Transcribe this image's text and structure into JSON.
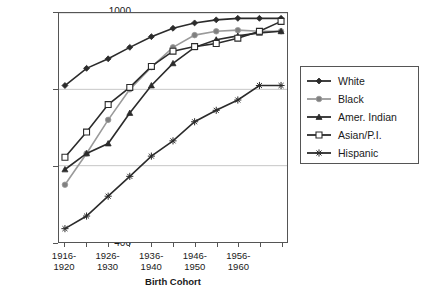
{
  "chart_data": {
    "type": "line",
    "title": "",
    "xlabel": "Birth Cohort",
    "ylabel": "Completion Ratio",
    "ylim": [
      400,
      1000
    ],
    "ytick_labels": [
      "1000",
      "800",
      "600",
      "400"
    ],
    "ytick_values": [
      1000,
      800,
      600,
      400
    ],
    "grid": "horizontal",
    "legend_position": "right-outside",
    "categories": [
      "1916-1920",
      "1921-1925",
      "1926-1930",
      "1931-1935",
      "1936-1940",
      "1941-1945",
      "1946-1950",
      "1951-1955",
      "1956-1960",
      "1961-1965",
      "1966-1970"
    ],
    "xtick_labels": [
      {
        "line1": "1916-",
        "line2": "1920",
        "index": 0
      },
      {
        "line1": "1926-",
        "line2": "1930",
        "index": 2
      },
      {
        "line1": "1936-",
        "line2": "1940",
        "index": 4
      },
      {
        "line1": "1946-",
        "line2": "1950",
        "index": 6
      },
      {
        "line1": "1956-",
        "line2": "1960",
        "index": 8
      }
    ],
    "series": [
      {
        "name": "White",
        "marker": "diamond",
        "color": "#2b2b2b",
        "fill": "#2b2b2b",
        "values": [
          810,
          855,
          880,
          910,
          938,
          960,
          974,
          982,
          986,
          986,
          986
        ]
      },
      {
        "name": "Black",
        "marker": "circle",
        "color": "#9a9a9a",
        "fill": "#808080",
        "values": [
          550,
          632,
          720,
          800,
          858,
          910,
          942,
          952,
          955,
          952,
          952
        ]
      },
      {
        "name": "Amer. Indian",
        "marker": "triangle",
        "color": "#2b2b2b",
        "fill": "#2b2b2b",
        "values": [
          590,
          632,
          658,
          738,
          810,
          868,
          910,
          930,
          940,
          948,
          952
        ]
      },
      {
        "name": "Asian/P.I.",
        "marker": "open-square",
        "color": "#2b2b2b",
        "fill": "#ffffff",
        "values": [
          622,
          688,
          760,
          805,
          860,
          900,
          912,
          920,
          934,
          952,
          978
        ]
      },
      {
        "name": "Hispanic",
        "marker": "asterisk",
        "color": "#2b2b2b",
        "fill": "#2b2b2b",
        "values": [
          435,
          468,
          520,
          572,
          625,
          665,
          715,
          745,
          772,
          810,
          810
        ]
      }
    ]
  },
  "legend": {
    "items": [
      {
        "label": "White"
      },
      {
        "label": "Black"
      },
      {
        "label": "Amer. Indian"
      },
      {
        "label": "Asian/P.I."
      },
      {
        "label": "Hispanic"
      }
    ]
  }
}
